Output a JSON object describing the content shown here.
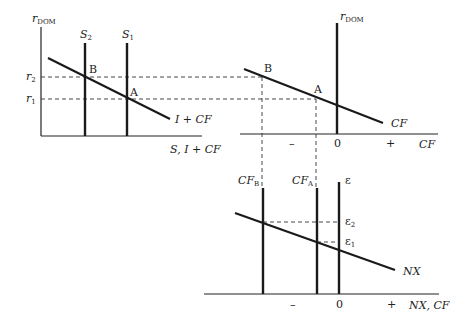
{
  "panels": {
    "loanable_funds": {
      "y_axis_label": "r",
      "y_axis_sub": "DOM",
      "x_axis_label": "S, I + CF",
      "supply_curves": [
        {
          "label": "S",
          "sub": "2"
        },
        {
          "label": "S",
          "sub": "1"
        }
      ],
      "demand_curve_label": "I + CF",
      "rate_labels": [
        {
          "label": "r",
          "sub": "2"
        },
        {
          "label": "r",
          "sub": "1"
        }
      ],
      "points": [
        "B",
        "A"
      ]
    },
    "capital_flows": {
      "y_axis_label": "r",
      "y_axis_sub": "DOM",
      "x_axis_label": "CF",
      "curve_label": "CF",
      "ticks": {
        "minus": "–",
        "zero": "0",
        "plus": "+"
      },
      "points": [
        "B",
        "A"
      ]
    },
    "foreign_exchange": {
      "y_axis_label": "ε",
      "x_axis_label": "NX, CF",
      "curve_label": "NX",
      "supply_curves": [
        {
          "label": "CF",
          "sub": "B"
        },
        {
          "label": "CF",
          "sub": "A"
        }
      ],
      "rate_labels": [
        {
          "label": "ε",
          "sub": "2"
        },
        {
          "label": "ε",
          "sub": "1"
        }
      ],
      "ticks": {
        "minus": "–",
        "zero": "0",
        "plus": "+"
      }
    }
  }
}
